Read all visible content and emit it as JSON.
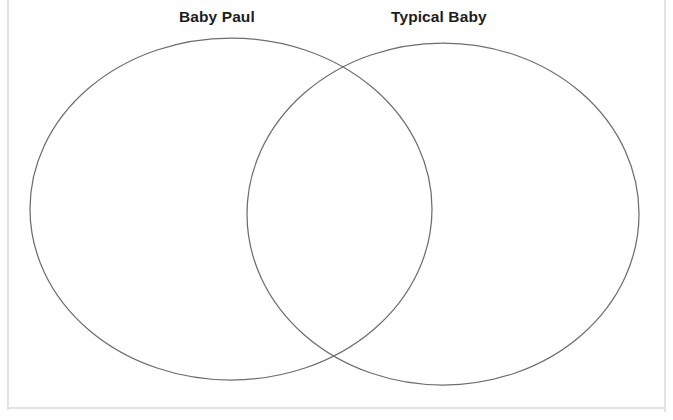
{
  "document": {
    "type": "venn-diagram-worksheet",
    "background_color": "#ffffff",
    "frame_color": "#e3e3e3"
  },
  "venn": {
    "stroke_color": "#6e6e6e",
    "stroke_width": 1.25,
    "fill": "none",
    "left_circle": {
      "label": "Baby Paul",
      "center_x": 231,
      "center_y": 209,
      "radius_x": 201,
      "radius_y": 171
    },
    "right_circle": {
      "label": "Typical Baby",
      "center_x": 443,
      "center_y": 214,
      "radius_x": 196,
      "radius_y": 171
    },
    "overlap_region": {
      "label": "",
      "contents": []
    }
  },
  "labels": {
    "left_title": "Baby Paul",
    "right_title": "Typical Baby",
    "title_color": "#1d1d1d"
  }
}
